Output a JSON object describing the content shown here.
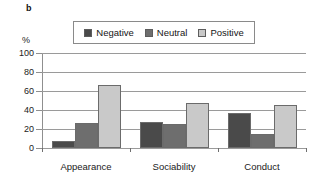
{
  "panel": {
    "label": "b"
  },
  "chart_data": {
    "type": "bar",
    "title": "",
    "subtitle": "",
    "xlabel": "",
    "ylabel": "%",
    "ylim": [
      0,
      100
    ],
    "yticks": [
      0,
      20,
      40,
      60,
      80,
      100
    ],
    "ytick_labels": [
      "0",
      "20",
      "40",
      "60",
      "80",
      "100"
    ],
    "grid": true,
    "grid_axis": "y",
    "legend_position": "top-center",
    "categories": [
      "Appearance",
      "Sociability",
      "Conduct"
    ],
    "series": [
      {
        "name": "Negative",
        "color": "#4a4a4a",
        "values": [
          7,
          27,
          37
        ]
      },
      {
        "name": "Neutral",
        "color": "#6e6e6e",
        "values": [
          26,
          25,
          15
        ]
      },
      {
        "name": "Positive",
        "color": "#c9c9c9",
        "values": [
          66,
          47,
          45
        ]
      }
    ]
  },
  "colors": {
    "negative": "#4a4a4a",
    "neutral": "#6e6e6e",
    "positive": "#c9c9c9",
    "gridline": "#9a9a9a",
    "axis": "#6f6f6f",
    "legend_border": "#8a8a8a",
    "background": "#ffffff"
  }
}
